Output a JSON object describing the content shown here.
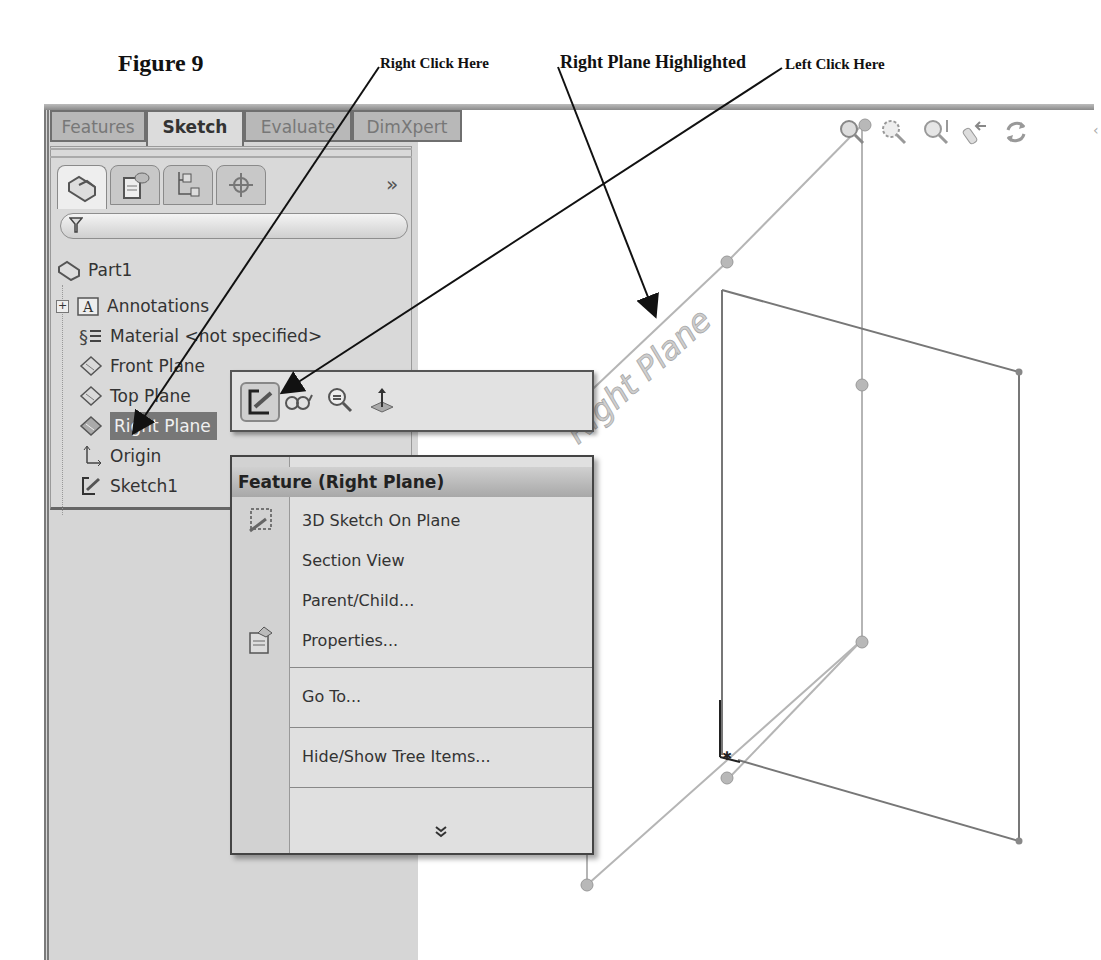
{
  "figure": {
    "title": "Figure 9",
    "annotations": {
      "right_click": "Right Click Here",
      "highlighted": "Right Plane Highlighted",
      "left_click": "Left Click Here"
    }
  },
  "command_manager": {
    "tabs": [
      {
        "label": "Features",
        "active": false
      },
      {
        "label": "Sketch",
        "active": true
      },
      {
        "label": "Evaluate",
        "active": false
      },
      {
        "label": "DimXpert",
        "active": false
      }
    ]
  },
  "manager_panel": {
    "tabs": [
      {
        "icon": "feature-manager-icon",
        "active": true
      },
      {
        "icon": "property-manager-icon",
        "active": false
      },
      {
        "icon": "configuration-manager-icon",
        "active": false
      },
      {
        "icon": "dimxpert-manager-icon",
        "active": false
      }
    ],
    "more_label": "»",
    "filter_icon": "filter-icon",
    "tree": {
      "root": "Part1",
      "items": [
        {
          "label": "Annotations",
          "icon": "annotations-icon",
          "expandable": true
        },
        {
          "label": "Material <not specified>",
          "icon": "material-icon"
        },
        {
          "label": "Front Plane",
          "icon": "plane-icon"
        },
        {
          "label": "Top Plane",
          "icon": "plane-icon"
        },
        {
          "label": "Right Plane",
          "icon": "plane-icon",
          "selected": true
        },
        {
          "label": "Origin",
          "icon": "origin-icon"
        },
        {
          "label": "Sketch1",
          "icon": "sketch-icon"
        }
      ]
    }
  },
  "context_toolbar": {
    "buttons": [
      {
        "name": "sketch",
        "icon": "sketch-icon"
      },
      {
        "name": "hide-show",
        "icon": "glasses-icon"
      },
      {
        "name": "zoom-to-selection",
        "icon": "zoom-selection-icon"
      },
      {
        "name": "normal-to",
        "icon": "normal-to-icon"
      }
    ]
  },
  "context_menu": {
    "header": "Feature (Right Plane)",
    "items": [
      {
        "label": "3D Sketch On Plane",
        "mnemonic": "3",
        "icon": "3d-sketch-icon"
      },
      {
        "label": "Section View",
        "mnemonic": "e"
      },
      {
        "label": "Parent/Child...",
        "mnemonic": "P"
      },
      {
        "label": "Properties...",
        "mnemonic": "r",
        "icon": "properties-icon"
      },
      {
        "label": "Go To...",
        "mnemonic": "G"
      },
      {
        "label": "Hide/Show Tree Items...",
        "mnemonic": "H"
      }
    ],
    "expand_label": "»"
  },
  "graphics_area": {
    "plane_label": "Right Plane",
    "view_toolbar": [
      "zoom-to-fit-icon",
      "zoom-to-area-icon",
      "zoom-in-out-icon",
      "previous-view-icon",
      "rotate-view-icon"
    ]
  }
}
